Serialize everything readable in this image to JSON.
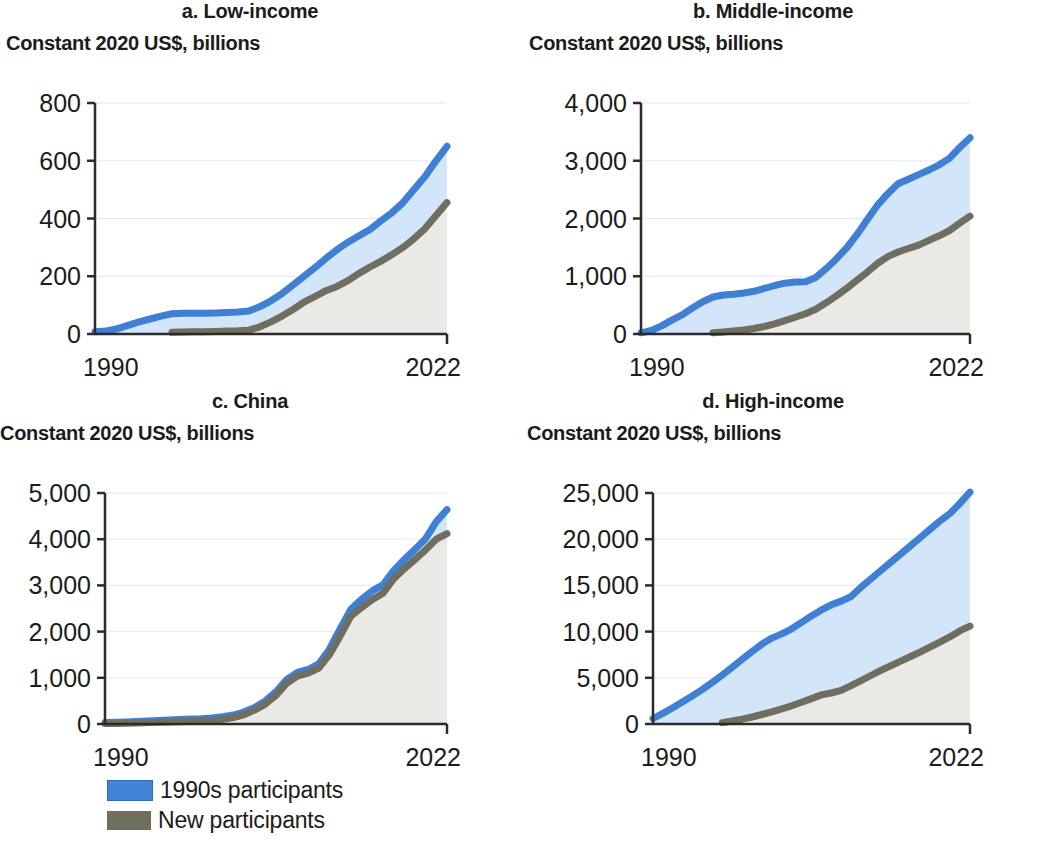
{
  "figure": {
    "axis_title": "Constant 2020 US$, billions",
    "x_start_label": "1990",
    "x_end_label": "2022"
  },
  "legend": {
    "items": [
      {
        "label": "1990s participants",
        "color": "#4285d6",
        "swatch_name": "legend-swatch-1990s-participants"
      },
      {
        "label": "New participants",
        "color": "#6f6e5f",
        "swatch_name": "legend-swatch-new-participants"
      }
    ]
  },
  "colors": {
    "line_blue": "#3f7fd4",
    "line_gray": "#6f6e5f",
    "fill_blue": "#cfe3f7",
    "fill_gray": "#ebe9e4",
    "axis": "#2b2b2b",
    "gridline": "#c8d8ec",
    "text": "#1b1b1b"
  },
  "chart_data": [
    {
      "type": "area",
      "panel": "a",
      "title": "a. Low-income",
      "ylabel": "Constant 2020 US$, billions",
      "xlabel": "",
      "ylim": [
        0,
        800
      ],
      "yticks": [
        0,
        200,
        400,
        600,
        800
      ],
      "ytick_labels": [
        "0",
        "200",
        "400",
        "600",
        "800"
      ],
      "xlim": [
        1990,
        2022
      ],
      "xticks": [
        1990,
        2022
      ],
      "xtick_labels": [
        "1990",
        "2022"
      ],
      "grid": true,
      "legend_position": "below-figure",
      "x": [
        1990,
        1991,
        1992,
        1993,
        1994,
        1995,
        1996,
        1997,
        1998,
        1999,
        2000,
        2001,
        2002,
        2003,
        2004,
        2005,
        2006,
        2007,
        2008,
        2009,
        2010,
        2011,
        2012,
        2013,
        2014,
        2015,
        2016,
        2017,
        2018,
        2019,
        2020,
        2021,
        2022
      ],
      "series": [
        {
          "name": "1990s participants",
          "values": [
            8,
            10,
            18,
            30,
            42,
            52,
            62,
            70,
            72,
            72,
            72,
            73,
            74,
            76,
            80,
            95,
            115,
            140,
            170,
            200,
            230,
            262,
            292,
            318,
            340,
            362,
            392,
            420,
            455,
            500,
            545,
            600,
            650
          ]
        },
        {
          "name": "New participants",
          "values": [
            0,
            0,
            0,
            0,
            0,
            0,
            0,
            6,
            7,
            8,
            8,
            9,
            10,
            11,
            13,
            25,
            42,
            62,
            85,
            110,
            130,
            150,
            165,
            185,
            210,
            232,
            252,
            275,
            300,
            330,
            365,
            410,
            455
          ]
        }
      ]
    },
    {
      "type": "area",
      "panel": "b",
      "title": "b. Middle-income",
      "ylabel": "Constant 2020 US$, billions",
      "xlabel": "",
      "ylim": [
        0,
        4000
      ],
      "yticks": [
        0,
        1000,
        2000,
        3000,
        4000
      ],
      "ytick_labels": [
        "0",
        "1,000",
        "2,000",
        "3,000",
        "4,000"
      ],
      "xlim": [
        1990,
        2022
      ],
      "xticks": [
        1990,
        2022
      ],
      "xtick_labels": [
        "1990",
        "2022"
      ],
      "grid": true,
      "legend_position": "below-figure",
      "x": [
        1990,
        1991,
        1992,
        1993,
        1994,
        1995,
        1996,
        1997,
        1998,
        1999,
        2000,
        2001,
        2002,
        2003,
        2004,
        2005,
        2006,
        2007,
        2008,
        2009,
        2010,
        2011,
        2012,
        2013,
        2014,
        2015,
        2016,
        2017,
        2018,
        2019,
        2020,
        2021,
        2022
      ],
      "series": [
        {
          "name": "1990s participants",
          "values": [
            20,
            60,
            140,
            240,
            330,
            450,
            560,
            640,
            675,
            690,
            710,
            740,
            790,
            840,
            880,
            900,
            905,
            980,
            1130,
            1300,
            1490,
            1720,
            1980,
            2230,
            2430,
            2600,
            2680,
            2760,
            2840,
            2930,
            3040,
            3230,
            3400
          ]
        },
        {
          "name": "New participants",
          "values": [
            0,
            0,
            0,
            0,
            0,
            0,
            0,
            20,
            35,
            50,
            70,
            95,
            130,
            175,
            230,
            290,
            350,
            430,
            540,
            660,
            790,
            930,
            1070,
            1220,
            1340,
            1420,
            1480,
            1540,
            1620,
            1700,
            1790,
            1920,
            2040
          ]
        }
      ]
    },
    {
      "type": "area",
      "panel": "c",
      "title": "c. China",
      "ylabel": "Constant 2020 US$, billions",
      "xlabel": "",
      "ylim": [
        0,
        5000
      ],
      "yticks": [
        0,
        1000,
        2000,
        3000,
        4000,
        5000
      ],
      "ytick_labels": [
        "0",
        "1,000",
        "2,000",
        "3,000",
        "4,000",
        "5,000"
      ],
      "xlim": [
        1990,
        2022
      ],
      "xticks": [
        1990,
        2022
      ],
      "xtick_labels": [
        "1990",
        "2022"
      ],
      "grid": true,
      "legend_position": "below-figure",
      "x": [
        1990,
        1991,
        1992,
        1993,
        1994,
        1995,
        1996,
        1997,
        1998,
        1999,
        2000,
        2001,
        2002,
        2003,
        2004,
        2005,
        2006,
        2007,
        2008,
        2009,
        2010,
        2011,
        2012,
        2013,
        2014,
        2015,
        2016,
        2017,
        2018,
        2019,
        2020,
        2021,
        2022
      ],
      "series": [
        {
          "name": "1990s participants",
          "values": [
            30,
            38,
            45,
            55,
            65,
            75,
            85,
            95,
            105,
            115,
            130,
            155,
            195,
            260,
            360,
            500,
            700,
            960,
            1120,
            1180,
            1300,
            1620,
            2060,
            2480,
            2700,
            2880,
            3010,
            3320,
            3560,
            3780,
            4010,
            4380,
            4640
          ]
        },
        {
          "name": "New participants",
          "values": [
            10,
            14,
            18,
            24,
            30,
            36,
            42,
            50,
            58,
            66,
            78,
            100,
            140,
            200,
            300,
            430,
            620,
            880,
            1040,
            1100,
            1210,
            1500,
            1900,
            2330,
            2520,
            2690,
            2830,
            3140,
            3360,
            3560,
            3770,
            4000,
            4120
          ]
        }
      ]
    },
    {
      "type": "area",
      "panel": "d",
      "title": "d. High-income",
      "ylabel": "Constant 2020 US$, billions",
      "xlabel": "",
      "ylim": [
        0,
        25000
      ],
      "yticks": [
        0,
        5000,
        10000,
        15000,
        20000,
        25000
      ],
      "ytick_labels": [
        "0",
        "5,000",
        "10,000",
        "15,000",
        "20,000",
        "25,000"
      ],
      "xlim": [
        1990,
        2022
      ],
      "xticks": [
        1990,
        2022
      ],
      "xtick_labels": [
        "1990",
        "2022"
      ],
      "grid": true,
      "legend_position": "below-figure",
      "x": [
        1990,
        1991,
        1992,
        1993,
        1994,
        1995,
        1996,
        1997,
        1998,
        1999,
        2000,
        2001,
        2002,
        2003,
        2004,
        2005,
        2006,
        2007,
        2008,
        2009,
        2010,
        2011,
        2012,
        2013,
        2014,
        2015,
        2016,
        2017,
        2018,
        2019,
        2020,
        2021,
        2022
      ],
      "series": [
        {
          "name": "1990s participants",
          "values": [
            600,
            1150,
            1750,
            2400,
            3050,
            3750,
            4500,
            5300,
            6150,
            7000,
            7850,
            8650,
            9300,
            9750,
            10300,
            11000,
            11700,
            12350,
            12900,
            13300,
            13800,
            14800,
            15700,
            16600,
            17500,
            18400,
            19300,
            20200,
            21100,
            22000,
            22800,
            23900,
            25100
          ]
        },
        {
          "name": "New participants",
          "values": [
            0,
            0,
            0,
            0,
            0,
            0,
            0,
            150,
            320,
            520,
            760,
            1030,
            1320,
            1630,
            1970,
            2350,
            2750,
            3150,
            3350,
            3650,
            4150,
            4700,
            5250,
            5800,
            6300,
            6800,
            7300,
            7800,
            8350,
            8900,
            9450,
            10100,
            10600
          ]
        }
      ]
    }
  ]
}
